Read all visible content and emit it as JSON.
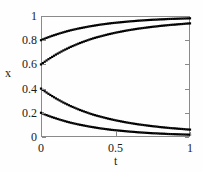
{
  "chart_data": {
    "type": "scatter",
    "title": "",
    "xlabel": "t",
    "ylabel": "x",
    "xlim": [
      0,
      1
    ],
    "ylim": [
      0,
      1
    ],
    "grid": false,
    "legend": "none",
    "marker": "square",
    "marker_color": "#000000",
    "xticks": [
      0,
      0.5,
      1
    ],
    "xtick_labels": [
      "0",
      "0.5",
      "1"
    ],
    "yticks": [
      0,
      0.2,
      0.4,
      0.6,
      0.8,
      1
    ],
    "ytick_labels": [
      "0",
      "0.2",
      "0.4",
      "0.6",
      "0.8",
      "1"
    ],
    "x": [
      0,
      0.025,
      0.05,
      0.075,
      0.1,
      0.125,
      0.15,
      0.175,
      0.2,
      0.225,
      0.25,
      0.275,
      0.3,
      0.325,
      0.35,
      0.375,
      0.4,
      0.425,
      0.45,
      0.475,
      0.5,
      0.525,
      0.55,
      0.575,
      0.6,
      0.625,
      0.65,
      0.675,
      0.7,
      0.725,
      0.75,
      0.775,
      0.8,
      0.825,
      0.85,
      0.875,
      0.9,
      0.925,
      0.95,
      0.975,
      1
    ],
    "series": [
      {
        "name": "x0 = 0.8",
        "values": [
          0.8,
          0.813,
          0.825,
          0.836,
          0.846,
          0.856,
          0.865,
          0.874,
          0.882,
          0.889,
          0.896,
          0.902,
          0.908,
          0.914,
          0.919,
          0.924,
          0.929,
          0.933,
          0.937,
          0.941,
          0.944,
          0.947,
          0.95,
          0.953,
          0.956,
          0.958,
          0.961,
          0.963,
          0.965,
          0.967,
          0.969,
          0.97,
          0.972,
          0.973,
          0.975,
          0.976,
          0.977,
          0.978,
          0.979,
          0.98,
          0.981
        ]
      },
      {
        "name": "x0 = 0.6",
        "values": [
          0.6,
          0.622,
          0.643,
          0.662,
          0.681,
          0.698,
          0.715,
          0.73,
          0.745,
          0.758,
          0.771,
          0.783,
          0.794,
          0.805,
          0.815,
          0.824,
          0.832,
          0.84,
          0.848,
          0.855,
          0.862,
          0.868,
          0.874,
          0.88,
          0.885,
          0.89,
          0.895,
          0.899,
          0.903,
          0.907,
          0.911,
          0.914,
          0.918,
          0.921,
          0.924,
          0.927,
          0.929,
          0.932,
          0.934,
          0.937,
          0.939
        ]
      },
      {
        "name": "x0 = 0.4",
        "values": [
          0.4,
          0.378,
          0.357,
          0.338,
          0.319,
          0.302,
          0.285,
          0.27,
          0.255,
          0.242,
          0.229,
          0.217,
          0.206,
          0.195,
          0.185,
          0.176,
          0.168,
          0.16,
          0.152,
          0.145,
          0.138,
          0.132,
          0.126,
          0.12,
          0.115,
          0.11,
          0.105,
          0.101,
          0.097,
          0.093,
          0.089,
          0.086,
          0.082,
          0.079,
          0.076,
          0.073,
          0.071,
          0.068,
          0.066,
          0.063,
          0.061
        ]
      },
      {
        "name": "x0 = 0.2",
        "values": [
          0.2,
          0.187,
          0.175,
          0.164,
          0.154,
          0.144,
          0.135,
          0.126,
          0.118,
          0.111,
          0.104,
          0.098,
          0.092,
          0.086,
          0.081,
          0.076,
          0.071,
          0.067,
          0.063,
          0.059,
          0.056,
          0.053,
          0.05,
          0.047,
          0.044,
          0.042,
          0.039,
          0.037,
          0.035,
          0.033,
          0.031,
          0.03,
          0.028,
          0.027,
          0.025,
          0.024,
          0.023,
          0.022,
          0.021,
          0.02,
          0.019
        ]
      }
    ]
  }
}
